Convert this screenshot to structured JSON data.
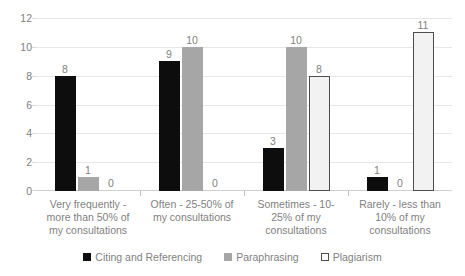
{
  "chart_data": {
    "type": "bar",
    "title": "",
    "subtitle": "",
    "xlabel": "",
    "ylabel": "",
    "ylim": [
      0,
      12
    ],
    "yticks": [
      0,
      2,
      4,
      6,
      8,
      10,
      12
    ],
    "grid": true,
    "legend_position": "bottom",
    "categories": [
      "Very frequently - more than 50% of my consultations",
      "Often - 25-50% of my consultations",
      "Sometimes - 10-25% of my consultations",
      "Rarely - less than 10% of my consultations"
    ],
    "series": [
      {
        "name": "Citing and Referencing",
        "color": "#0d0d0d",
        "values": [
          8,
          9,
          3,
          1
        ]
      },
      {
        "name": "Paraphrasing",
        "color": "#a6a6a6",
        "values": [
          1,
          10,
          10,
          0
        ]
      },
      {
        "name": "Plagiarism",
        "color": "#f2f2f2",
        "values": [
          0,
          0,
          8,
          11
        ]
      }
    ],
    "data_labels": [
      [
        "8",
        "1",
        "0"
      ],
      [
        "9",
        "10",
        "0"
      ],
      [
        "3",
        "10",
        "8"
      ],
      [
        "1",
        "0",
        "11"
      ]
    ]
  },
  "axes": {
    "y_tick_labels": [
      "12",
      "10",
      "8",
      "6",
      "4",
      "2",
      "0"
    ]
  },
  "legend": {
    "items": [
      {
        "label": "Citing and Referencing"
      },
      {
        "label": "Paraphrasing"
      },
      {
        "label": "Plagiarism"
      }
    ]
  }
}
